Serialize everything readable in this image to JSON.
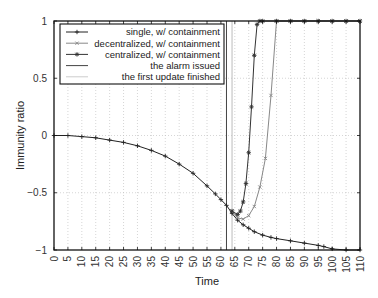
{
  "chart_data": {
    "type": "line",
    "title": "",
    "xlabel": "Time",
    "ylabel": "Immunity ratio",
    "xlim": [
      0,
      110
    ],
    "ylim": [
      -1,
      1
    ],
    "xticks": [
      0,
      5,
      10,
      15,
      20,
      25,
      30,
      35,
      40,
      45,
      50,
      55,
      60,
      65,
      70,
      75,
      80,
      85,
      90,
      95,
      100,
      105,
      110
    ],
    "yticks": [
      -1,
      -0.5,
      0,
      0.5,
      1
    ],
    "ytick_labels": [
      "-1",
      "-0.5",
      "0",
      "0.5",
      "1"
    ],
    "grid": true,
    "legend_position": "upper left",
    "legend": [
      "single, w/ containment",
      "decentralized, w/ containment",
      "centralized, w/ containment",
      "the alarm issued",
      "the first update finished"
    ],
    "series": [
      {
        "name": "single, w/ containment",
        "color": "#222222",
        "marker": "plus",
        "x": [
          0,
          5,
          10,
          15,
          20,
          25,
          30,
          35,
          40,
          45,
          50,
          55,
          58,
          60,
          62,
          64,
          66,
          68,
          70,
          72,
          75,
          78,
          80,
          85,
          90,
          95,
          97,
          100,
          105,
          110
        ],
        "y": [
          0,
          0,
          -0.01,
          -0.02,
          -0.04,
          -0.06,
          -0.09,
          -0.13,
          -0.18,
          -0.25,
          -0.33,
          -0.44,
          -0.51,
          -0.56,
          -0.61,
          -0.68,
          -0.74,
          -0.78,
          -0.81,
          -0.84,
          -0.87,
          -0.89,
          -0.9,
          -0.92,
          -0.94,
          -0.96,
          -0.97,
          -0.99,
          -1,
          -1
        ]
      },
      {
        "name": "decentralized, w/ containment",
        "color": "#888888",
        "marker": "x",
        "x": [
          64,
          66,
          68,
          70,
          72,
          74,
          76,
          78,
          80,
          85,
          90,
          95,
          100,
          105,
          110
        ],
        "y": [
          -0.66,
          -0.72,
          -0.73,
          -0.7,
          -0.62,
          -0.45,
          -0.2,
          0.35,
          1,
          1,
          1,
          1,
          1,
          1,
          1
        ]
      },
      {
        "name": "centralized, w/ containment",
        "color": "#333333",
        "marker": "asterisk",
        "x": [
          64,
          66,
          67,
          68,
          69,
          70,
          71,
          72,
          73,
          74,
          75,
          80,
          85,
          90,
          95,
          100,
          105,
          110
        ],
        "y": [
          -0.66,
          -0.69,
          -0.66,
          -0.58,
          -0.42,
          -0.15,
          0.25,
          0.7,
          0.97,
          1,
          1,
          1,
          1,
          1,
          1,
          1,
          1,
          1
        ]
      },
      {
        "name": "the alarm issued",
        "type": "vline",
        "x": 62,
        "color": "#444444"
      },
      {
        "name": "the first update finished",
        "type": "vline",
        "x": 64,
        "color": "#bbbbbb"
      }
    ]
  }
}
